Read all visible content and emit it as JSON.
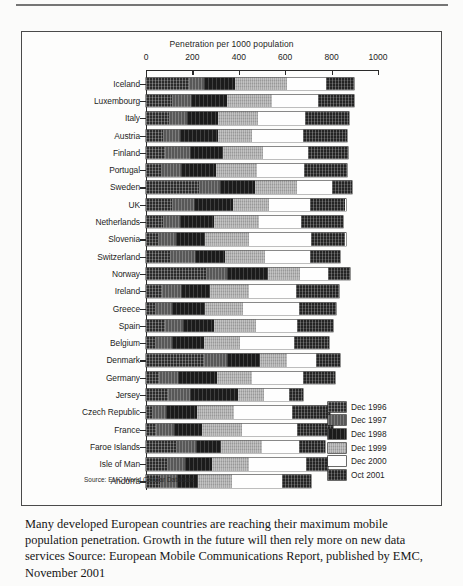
{
  "page": {
    "caption": "Many developed European countries are reaching their maximum mobile population penetration. Growth in the future will then rely more on new data services Source: European Mobile Communications Report, published by EMC, November 2001",
    "source_note": "Source: EMC World Cellular Database"
  },
  "chart_data": {
    "type": "bar",
    "orientation": "horizontal",
    "stacked": true,
    "title": "Penetration per 1000 population",
    "xlabel": "Penetration per 1000 population",
    "ylabel": "",
    "xlim": [
      0,
      1000
    ],
    "xticks": [
      0,
      200,
      400,
      600,
      800,
      1000
    ],
    "grid": false,
    "legend_position": "bottom-right",
    "legend": [
      "Dec 1996",
      "Dec 1997",
      "Dec 1998",
      "Dec 1999",
      "Dec 2000",
      "Oct 2001"
    ],
    "colors": [
      "#2b2b2b",
      "#585858",
      "#1b1b1b",
      "#a9a9a9",
      "#fefefe",
      "#242424"
    ],
    "categories": [
      "Iceland",
      "Luxembourg",
      "Italy",
      "Austria",
      "Finland",
      "Portugal",
      "Sweden",
      "UK",
      "Netherlands",
      "Slovenia",
      "Switzerland",
      "Norway",
      "Ireland",
      "Greece",
      "Spain",
      "Belgium",
      "Denmark",
      "Germany",
      "Jersey",
      "Czech Republic",
      "France",
      "Faroe Islands",
      "Isle of Man",
      "Andorra"
    ],
    "series": [
      {
        "name": "Dec 1996",
        "values": [
          185,
          110,
          100,
          75,
          80,
          65,
          230,
          110,
          75,
          50,
          105,
          260,
          70,
          40,
          80,
          40,
          250,
          55,
          95,
          25,
          45,
          130,
          90,
          60
        ]
      },
      {
        "name": "Dec 1997",
        "values": [
          65,
          85,
          75,
          70,
          110,
          85,
          90,
          95,
          70,
          80,
          105,
          90,
          80,
          70,
          80,
          70,
          100,
          85,
          95,
          60,
          75,
          85,
          80,
          75
        ]
      },
      {
        "name": "Dec 1998",
        "values": [
          135,
          155,
          135,
          165,
          140,
          150,
          150,
          170,
          150,
          125,
          130,
          175,
          125,
          145,
          135,
          140,
          140,
          165,
          205,
          135,
          120,
          110,
          115,
          90
        ]
      },
      {
        "name": "Dec 1999",
        "values": [
          225,
          195,
          175,
          145,
          175,
          180,
          180,
          155,
          190,
          190,
          175,
          140,
          170,
          165,
          180,
          155,
          120,
          150,
          115,
          160,
          175,
          175,
          160,
          145
        ]
      },
      {
        "name": "Dec 2000",
        "values": [
          165,
          195,
          200,
          220,
          195,
          200,
          150,
          175,
          185,
          265,
          190,
          120,
          200,
          240,
          175,
          235,
          125,
          220,
          105,
          250,
          235,
          160,
          245,
          215
        ]
      },
      {
        "name": "Oct 2001",
        "values": [
          120,
          155,
          190,
          190,
          170,
          185,
          90,
          155,
          180,
          150,
          130,
          95,
          185,
          160,
          155,
          150,
          100,
          140,
          60,
          165,
          155,
          110,
          95,
          125
        ]
      }
    ],
    "totals": [
      895,
      895,
      875,
      865,
      870,
      865,
      890,
      860,
      850,
      860,
      835,
      880,
      830,
      820,
      805,
      790,
      835,
      815,
      675,
      795,
      805,
      770,
      785,
      710
    ]
  }
}
